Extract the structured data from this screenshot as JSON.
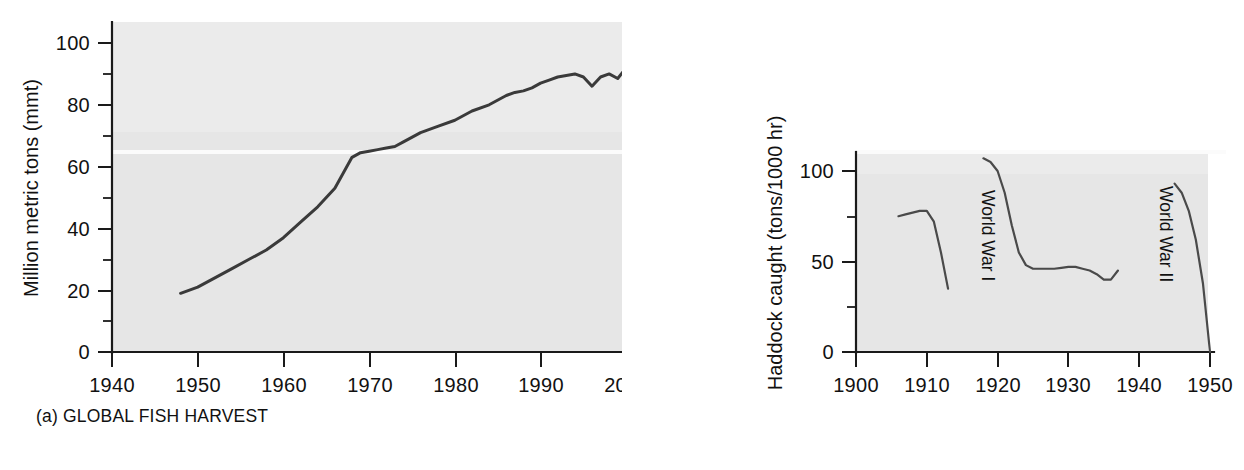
{
  "figure": {
    "background": "#ffffff",
    "plot_background": "#e6e6e6",
    "line_color": "#3a3a3a"
  },
  "panel_a": {
    "caption": "(a) GLOBAL FISH HARVEST",
    "ylabel": "Million metric tons (mmt)",
    "y_ticks": [
      "0",
      "20",
      "40",
      "60",
      "80",
      "100"
    ],
    "x_ticks": [
      "1940",
      "1950",
      "1960",
      "1970",
      "1980",
      "1990",
      "2000",
      "2010"
    ]
  },
  "panel_b": {
    "caption": "(b) HADDOCK CATCH IN NORTH SEA",
    "ylabel": "Haddock caught (tons/1000 hr)",
    "y_ticks": [
      "0",
      "50",
      "100"
    ],
    "x_ticks": [
      "1900",
      "1910",
      "1920",
      "1930",
      "1940",
      "1950"
    ],
    "annotations": [
      {
        "label": "World War I"
      },
      {
        "label": "World War II"
      }
    ]
  },
  "chart_data": [
    {
      "type": "line",
      "id": "global-fish-harvest",
      "title": "(a) GLOBAL FISH HARVEST",
      "xlabel": "",
      "ylabel": "Million metric tons (mmt)",
      "xlim": [
        1940,
        2010
      ],
      "ylim": [
        0,
        105
      ],
      "x_ticks": [
        1940,
        1950,
        1960,
        1970,
        1980,
        1990,
        2000,
        2010
      ],
      "y_ticks": [
        0,
        20,
        40,
        60,
        80,
        100
      ],
      "y_minor_ticks": [
        10,
        30,
        50,
        70,
        90
      ],
      "grid": false,
      "legend": "none",
      "series": [
        {
          "name": "Global fish harvest",
          "x": [
            1948,
            1950,
            1952,
            1954,
            1956,
            1958,
            1960,
            1962,
            1964,
            1966,
            1967,
            1968,
            1969,
            1970,
            1971,
            1972,
            1973,
            1974,
            1976,
            1978,
            1980,
            1982,
            1984,
            1986,
            1987,
            1988,
            1989,
            1990,
            1991,
            1992,
            1993,
            1994,
            1995,
            1996,
            1997,
            1998,
            1999,
            2000,
            2001,
            2002,
            2003,
            2004,
            2005,
            2006,
            2007,
            2008,
            2009
          ],
          "values": [
            19,
            21,
            24,
            27,
            30,
            33,
            37,
            42,
            47,
            53,
            58,
            63,
            64.5,
            65,
            65.5,
            66,
            66.5,
            68,
            71,
            73,
            75,
            78,
            80,
            83,
            84,
            84.5,
            85.5,
            87,
            88,
            89,
            89.5,
            90,
            89,
            86,
            89,
            90,
            88.5,
            92,
            91.5,
            90,
            92.5,
            95,
            96.5,
            97.5,
            98,
            98.5,
            98.5
          ]
        }
      ]
    },
    {
      "type": "line",
      "id": "haddock-catch-north-sea",
      "title": "(b) HADDOCK CATCH IN NORTH SEA",
      "xlabel": "",
      "ylabel": "Haddock caught (tons/1000 hr)",
      "xlim": [
        1900,
        1950
      ],
      "ylim": [
        0,
        108
      ],
      "x_ticks": [
        1900,
        1910,
        1920,
        1930,
        1940,
        1950
      ],
      "y_ticks": [
        0,
        50,
        100
      ],
      "y_minor_ticks": [
        25,
        75
      ],
      "grid": false,
      "legend": "none",
      "annotations": [
        {
          "text": "World War I",
          "x_range": [
            1914,
            1918
          ]
        },
        {
          "text": "World War II",
          "x_range": [
            1939,
            1945
          ]
        }
      ],
      "series": [
        {
          "name": "Pre-WWI",
          "x": [
            1906,
            1907,
            1908,
            1909,
            1910,
            1911,
            1912,
            1913
          ],
          "values": [
            75,
            76,
            77,
            78,
            78,
            72,
            55,
            35
          ]
        },
        {
          "name": "Interwar",
          "x": [
            1918,
            1919,
            1920,
            1921,
            1922,
            1923,
            1924,
            1925,
            1926,
            1927,
            1928,
            1929,
            1930,
            1931,
            1932,
            1933,
            1934,
            1935,
            1936,
            1937
          ],
          "values": [
            107,
            105,
            100,
            88,
            70,
            55,
            48,
            46,
            46,
            46,
            46,
            46.5,
            47,
            47,
            46,
            45,
            43,
            40,
            40,
            45
          ]
        },
        {
          "name": "Post-WWII",
          "x": [
            1945,
            1946,
            1947,
            1948,
            1949,
            1950
          ],
          "values": [
            93,
            88,
            78,
            62,
            38,
            0
          ]
        }
      ]
    }
  ]
}
